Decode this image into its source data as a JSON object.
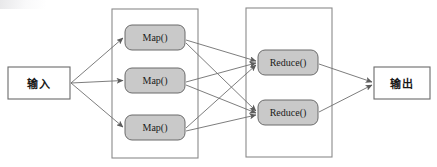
{
  "diagram": {
    "type": "flow-diagram",
    "canvas": {
      "width": 437,
      "height": 167,
      "background": "#ffffff"
    },
    "style": {
      "stroke_color": "#6e6e6e",
      "node_stroke_color": "#6b6b6b",
      "container_stroke_color": "#8a8a8a",
      "map_fill": "#c9c9c9",
      "reduce_fill": "#c9c9c9",
      "io_fill": "#ffffff",
      "text_color": "#1a1a1a"
    },
    "nodes": {
      "input": {
        "label": "输入",
        "shape": "rectangle",
        "x": 8,
        "y": 67,
        "width": 62,
        "height": 32,
        "fill": "#ffffff"
      },
      "output": {
        "label": "输出",
        "shape": "rectangle",
        "x": 374,
        "y": 67,
        "width": 56,
        "height": 32,
        "fill": "#ffffff"
      },
      "maps": [
        {
          "label": "Map()",
          "x": 125,
          "y": 25,
          "width": 60,
          "height": 25
        },
        {
          "label": "Map()",
          "x": 125,
          "y": 68,
          "width": 60,
          "height": 25
        },
        {
          "label": "Map()",
          "x": 125,
          "y": 115,
          "width": 60,
          "height": 25
        }
      ],
      "reduces": [
        {
          "label": "Reduce()",
          "x": 258,
          "y": 50,
          "width": 60,
          "height": 25
        },
        {
          "label": "Reduce()",
          "x": 258,
          "y": 100,
          "width": 60,
          "height": 25
        }
      ]
    },
    "containers": [
      {
        "name": "map-phase-container",
        "x": 112,
        "y": 9,
        "width": 86,
        "height": 149
      },
      {
        "name": "reduce-phase-container",
        "x": 246,
        "y": 8,
        "width": 86,
        "height": 149
      }
    ],
    "edges": [
      {
        "from": "input",
        "to": "map-1"
      },
      {
        "from": "input",
        "to": "map-2"
      },
      {
        "from": "input",
        "to": "map-3"
      },
      {
        "from": "map-1",
        "to": "reduce-1"
      },
      {
        "from": "map-1",
        "to": "reduce-2"
      },
      {
        "from": "map-2",
        "to": "reduce-1"
      },
      {
        "from": "map-2",
        "to": "reduce-2"
      },
      {
        "from": "map-3",
        "to": "reduce-1"
      },
      {
        "from": "map-3",
        "to": "reduce-2"
      },
      {
        "from": "reduce-1",
        "to": "output"
      },
      {
        "from": "reduce-2",
        "to": "output"
      }
    ]
  }
}
